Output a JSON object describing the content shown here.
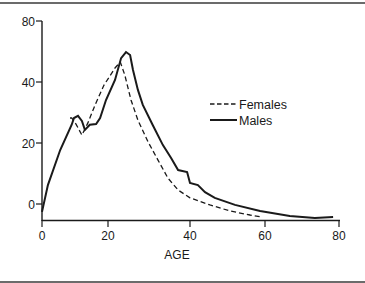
{
  "chart_data": {
    "type": "line",
    "title": "",
    "xlabel": "AGE",
    "ylabel": "",
    "xlim": [
      0,
      80
    ],
    "ylim": [
      -5,
      80
    ],
    "grid": false,
    "legend_position": "right-center",
    "x_ticks": [
      0,
      20,
      40,
      60,
      80
    ],
    "y_ticks": [
      0,
      20,
      40,
      80
    ],
    "series": [
      {
        "name": "Females",
        "style": "dashed",
        "x": [
          8.5,
          9,
          10.3,
          12.1,
          13.9,
          16.1,
          18.8,
          21.7,
          23,
          24.1,
          25.6,
          27.3,
          29.8,
          32.2,
          34.6,
          37.1,
          40,
          45.3,
          50.7,
          56,
          59.2
        ],
        "y": [
          28.2,
          28.2,
          26.2,
          22.6,
          26.6,
          32.5,
          39,
          49.2,
          53.1,
          44.6,
          34.1,
          27.5,
          20.3,
          14.4,
          8.5,
          4.6,
          2,
          -0.3,
          -2.3,
          -3.6,
          -4.3
        ]
      },
      {
        "name": "Males",
        "style": "solid",
        "x": [
          0,
          1.8,
          5.5,
          9,
          9.7,
          10.9,
          12.1,
          13,
          14.5,
          16.4,
          17.6,
          19.4,
          21.7,
          23.2,
          24.4,
          25.4,
          26.1,
          27.3,
          28.5,
          30.9,
          33.4,
          35.4,
          37.1,
          39.3,
          40,
          42.1,
          44,
          46.6,
          52,
          58.7,
          66.7,
          73.5,
          78.4
        ],
        "y": [
          -2.6,
          6.2,
          17.7,
          26,
          28.2,
          28.9,
          27.2,
          24.3,
          26,
          26.2,
          28.2,
          34.1,
          41.3,
          55.7,
          59.7,
          57.7,
          47.9,
          37.4,
          32.5,
          25.9,
          19.3,
          15.1,
          11.1,
          10.5,
          6.9,
          6.2,
          3.9,
          2,
          -0.3,
          -2.3,
          -3.9,
          -4.6,
          -4.3
        ]
      }
    ]
  },
  "axes": {
    "x_ticks": [
      {
        "label": "0",
        "px": 42
      },
      {
        "label": "20",
        "px": 108
      },
      {
        "label": "40",
        "px": 190
      },
      {
        "label": "60",
        "px": 265
      },
      {
        "label": "80",
        "px": 339
      }
    ],
    "y_ticks": [
      {
        "label": "80",
        "py": 21
      },
      {
        "label": "40",
        "py": 82
      },
      {
        "label": "20",
        "py": 143
      },
      {
        "label": "0",
        "py": 204
      }
    ],
    "x_title": "AGE"
  },
  "legend": {
    "females": "Females",
    "males": "Males"
  },
  "colors": {
    "ink": "#1a1a1a",
    "frame": "#6b6b6b",
    "background": "#ffffff"
  }
}
